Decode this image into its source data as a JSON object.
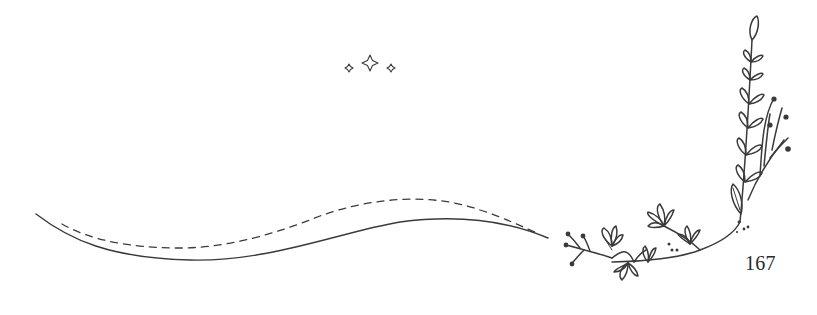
{
  "page": {
    "number": "167",
    "ink_color": "#3a3a3a",
    "background": "#ffffff"
  },
  "ornaments": {
    "sparkles": {
      "icon": "sparkle-icon",
      "count": 3
    },
    "wave": {
      "icon": "wavy-line-icon",
      "styles": [
        "solid",
        "dashed"
      ]
    },
    "botanical": {
      "icon": "leafy-branch-icon"
    }
  }
}
